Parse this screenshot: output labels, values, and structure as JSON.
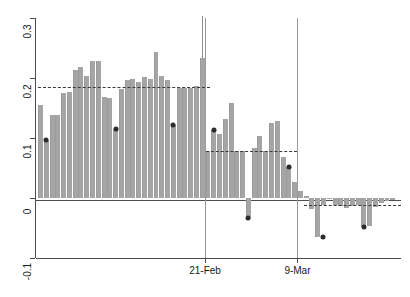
{
  "chart_data": {
    "type": "bar",
    "title": "",
    "xlabel": "",
    "ylabel": "",
    "ylim": [
      -0.1,
      0.3
    ],
    "yticks": [
      0.3,
      0.2,
      0.1,
      0,
      -0.1
    ],
    "ytick_labels": [
      "0.3",
      "0.2",
      "0.1",
      "0",
      "-0.1"
    ],
    "xticks": [
      22,
      38
    ],
    "xtick_labels": [
      "21-Feb",
      "9-Mar"
    ],
    "grid": false,
    "legend": null,
    "bar_color": "#a5a5a5",
    "dot_color": "#2b2b2b",
    "reference_line_color": "#3a3a3a",
    "event_line_color": "#9a9a9a",
    "axis_color": "#4d4d4d",
    "n_bars": 47,
    "values": [
      0.155,
      0.097,
      0.138,
      0.138,
      0.175,
      0.177,
      0.213,
      0.218,
      0.203,
      0.228,
      0.229,
      0.168,
      0.166,
      0.115,
      0.182,
      0.196,
      0.199,
      0.194,
      0.202,
      0.199,
      0.244,
      0.204,
      0.196,
      0.122,
      0.183,
      0.183,
      0.183,
      0.186,
      0.234,
      0.079,
      0.113,
      0.106,
      0.132,
      0.159,
      0.079,
      0.079,
      -0.034,
      0.083,
      0.104,
      0.078,
      0.125,
      0.128,
      0.068,
      0.052,
      0.026,
      0.012,
      0.004
    ],
    "values_right": [
      -0.018,
      -0.065,
      -0.012,
      -0.002,
      -0.012,
      -0.013,
      -0.016,
      -0.013,
      -0.012,
      -0.049,
      -0.046,
      -0.015,
      -0.008,
      -0.005,
      -0.003
    ],
    "dots": [
      {
        "index": 1,
        "value": 0.097
      },
      {
        "index": 13,
        "value": 0.115
      },
      {
        "index": 23,
        "value": 0.122
      },
      {
        "index": 30,
        "value": 0.113
      },
      {
        "index": 36,
        "value": -0.034
      },
      {
        "index": 43,
        "value": 0.052
      },
      {
        "index": 49,
        "value": -0.065
      },
      {
        "index": 56,
        "value": -0.049
      }
    ],
    "reference_levels": [
      {
        "value": 0.185,
        "from_index": 0,
        "to_index": 29
      },
      {
        "value": 0.078,
        "from_index": 29,
        "to_index": 44
      },
      {
        "value": -0.012,
        "from_index": 46,
        "to_index": 62
      }
    ],
    "event_lines": [
      {
        "label": "21-Feb",
        "index": 29
      },
      {
        "label": "9-Mar",
        "index": 45
      }
    ],
    "spike": {
      "index": 28,
      "top": 0.303,
      "bottom": 0.234
    }
  }
}
